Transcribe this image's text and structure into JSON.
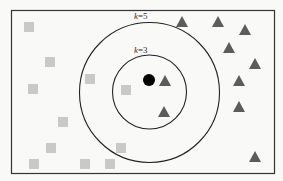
{
  "diagram": {
    "colors": {
      "background": "#f9f9f7",
      "frame": "#333333",
      "circle": "#222222",
      "class_a_square": "#c9c9c9",
      "class_b_triangle": "#5c5c5c",
      "query_point": "#000000"
    },
    "labels": {
      "outer_k": "k",
      "outer_eq": "=5",
      "inner_k": "k",
      "inner_eq": "=3"
    },
    "neighborhoods": [
      {
        "name": "k=5",
        "k": 5
      },
      {
        "name": "k=3",
        "k": 3
      }
    ],
    "query_point": {
      "class": "unknown",
      "shape": "circle"
    },
    "class_a": {
      "shape": "square",
      "count": 11
    },
    "class_b": {
      "shape": "triangle",
      "count": 10
    }
  }
}
